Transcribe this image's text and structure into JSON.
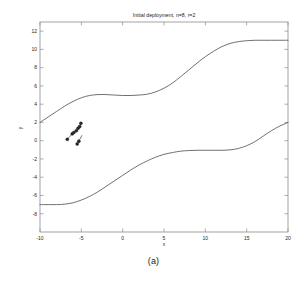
{
  "figure": {
    "caption": "(a)",
    "background_color": "#ffffff",
    "line_color": "#4d4d4d",
    "axis_color": "#8c8c8c",
    "marker_color": "#262626"
  },
  "chart_data": {
    "type": "line",
    "title": "Initial deployment, n=8, r=2",
    "xlabel": "x",
    "ylabel": "y",
    "xlim": [
      -10,
      20
    ],
    "ylim": [
      -10,
      13
    ],
    "xticks": [
      -10,
      -5,
      0,
      5,
      10,
      15,
      20
    ],
    "xticklabels": [
      "-10",
      "-5",
      "0",
      "5",
      "10",
      "15",
      "20"
    ],
    "yticks": [
      -8,
      -6,
      -4,
      -2,
      0,
      2,
      4,
      6,
      8,
      10,
      12
    ],
    "yticklabels": [
      "-8",
      "-6",
      "-4",
      "-2",
      "0",
      "2",
      "4",
      "6",
      "8",
      "10",
      "12"
    ],
    "grid": false,
    "legend": false,
    "series": [
      {
        "name": "upper boundary",
        "type": "line",
        "x": [
          -10,
          -9,
          -8,
          -7,
          -6,
          -5,
          -4,
          -3,
          -2,
          -1,
          0,
          1,
          2,
          3,
          4,
          5,
          6,
          7,
          8,
          9,
          10,
          11,
          12,
          13,
          14,
          15,
          16,
          17,
          18,
          19,
          20
        ],
        "y": [
          2.0,
          2.6,
          3.2,
          3.8,
          4.3,
          4.7,
          4.95,
          5.05,
          5.05,
          5.0,
          4.95,
          4.95,
          5.0,
          5.1,
          5.35,
          5.75,
          6.3,
          7.0,
          7.75,
          8.5,
          9.2,
          9.8,
          10.3,
          10.65,
          10.85,
          10.95,
          11.0,
          11.0,
          11.0,
          11.0,
          11.0
        ]
      },
      {
        "name": "lower boundary",
        "type": "line",
        "x": [
          -10,
          -9,
          -8,
          -7,
          -6,
          -5,
          -4,
          -3,
          -2,
          -1,
          0,
          1,
          2,
          3,
          4,
          5,
          6,
          7,
          8,
          9,
          10,
          11,
          12,
          13,
          14,
          15,
          16,
          17,
          18,
          19,
          20
        ],
        "y": [
          -7.0,
          -7.0,
          -7.0,
          -6.95,
          -6.8,
          -6.5,
          -6.1,
          -5.6,
          -5.0,
          -4.4,
          -3.8,
          -3.2,
          -2.65,
          -2.2,
          -1.8,
          -1.5,
          -1.3,
          -1.15,
          -1.08,
          -1.05,
          -1.05,
          -1.05,
          -1.05,
          -1.0,
          -0.85,
          -0.55,
          -0.1,
          0.5,
          1.1,
          1.6,
          2.0
        ]
      },
      {
        "name": "sensor nodes",
        "type": "scatter",
        "marker": "o",
        "x": [
          -6.7,
          -6.1,
          -5.9,
          -5.6,
          -5.4,
          -5.2,
          -5.05,
          -5.5,
          -5.3
        ],
        "y": [
          0.15,
          0.75,
          0.9,
          1.1,
          1.35,
          1.55,
          1.9,
          -0.35,
          -0.05
        ]
      },
      {
        "name": "node links",
        "type": "line",
        "x": [
          -6.7,
          -6.1,
          -5.9,
          -5.6,
          -5.4,
          -5.2,
          -5.05
        ],
        "y": [
          0.15,
          0.75,
          0.9,
          1.1,
          1.35,
          1.55,
          1.9
        ]
      },
      {
        "name": "node links 2",
        "type": "line",
        "x": [
          -5.5,
          -5.3,
          -4.95
        ],
        "y": [
          -0.35,
          -0.05,
          0.55
        ]
      }
    ]
  }
}
